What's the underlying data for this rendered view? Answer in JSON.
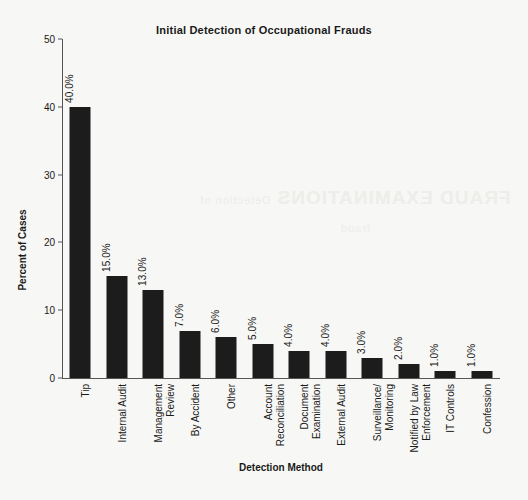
{
  "chart_data": {
    "type": "bar",
    "title": "Initial Detection of Occupational Frauds",
    "xlabel": "Detection Method",
    "ylabel": "Percent of Cases",
    "ylim": [
      0,
      50
    ],
    "yticks": [
      0,
      10,
      20,
      30,
      40,
      50
    ],
    "grid": false,
    "legend": null,
    "categories": [
      "Tip",
      "Internal Audit",
      "Management Review",
      "By Accident",
      "Other",
      "Account Reconciliation",
      "Document Examination",
      "External Audit",
      "Surveillance/ Monitoring",
      "Notified by Law Enforcement",
      "IT Controls",
      "Confession"
    ],
    "values": [
      40.0,
      15.0,
      13.0,
      7.0,
      6.0,
      5.0,
      4.0,
      4.0,
      3.0,
      2.0,
      1.0,
      1.0
    ],
    "value_labels": [
      "40.0%",
      "15.0%",
      "13.0%",
      "7.0%",
      "6.0%",
      "5.0%",
      "4.0%",
      "4.0%",
      "3.0%",
      "2.0%",
      "1.0%",
      "1.0%"
    ],
    "category_lines": [
      [
        "Tip"
      ],
      [
        "Internal Audit"
      ],
      [
        "Management",
        "Review"
      ],
      [
        "By Accident"
      ],
      [
        "Other"
      ],
      [
        "Account",
        "Reconciliation"
      ],
      [
        "Document",
        "Examination"
      ],
      [
        "External Audit"
      ],
      [
        "Surveillance/",
        "Monitoring"
      ],
      [
        "Notified by Law",
        "Enforcement"
      ],
      [
        "IT Controls"
      ],
      [
        "Confession"
      ]
    ],
    "bar_color": "#1c1c1c",
    "background_color": "#f7f7f5"
  },
  "scan_bleed": {
    "line1": "FRAUD EXAMINATIONS",
    "line2": "Detection of fraud"
  }
}
